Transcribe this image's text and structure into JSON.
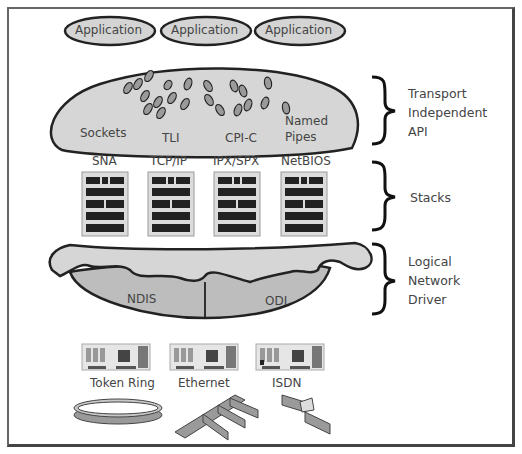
{
  "applications": [
    {
      "label": "Application"
    },
    {
      "label": "Application"
    },
    {
      "label": "Application"
    }
  ],
  "apis": [
    {
      "label": "Sockets"
    },
    {
      "label": "TLI"
    },
    {
      "label": "CPI-C"
    },
    {
      "label": "Named",
      "label2": "Pipes"
    }
  ],
  "stacks": [
    {
      "label": "SNA"
    },
    {
      "label": "TCP/IP"
    },
    {
      "label": "IPX/SPX"
    },
    {
      "label": "NetBIOS"
    }
  ],
  "drivers": [
    {
      "label": "NDIS"
    },
    {
      "label": "ODI"
    }
  ],
  "networks": [
    {
      "label": "Token Ring"
    },
    {
      "label": "Ethernet"
    },
    {
      "label": "ISDN"
    }
  ],
  "layers": [
    {
      "line1": "Transport",
      "line2": "Independent",
      "line3": "API"
    },
    {
      "line1": "Stacks"
    },
    {
      "line1": "Logical",
      "line2": "Network",
      "line3": "Driver"
    }
  ],
  "colors": {
    "fill_light": "#d9d9d9",
    "fill_mid": "#bdbdbd",
    "fill_dark": "#9a9a9a",
    "stroke": "#222222"
  }
}
